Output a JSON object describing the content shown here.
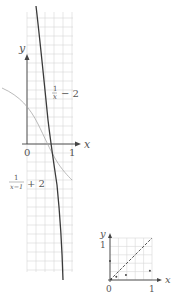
{
  "diagram": {
    "main_graph": {
      "x_axis_label": "x",
      "y_axis_label": "y",
      "origin_label": "0",
      "x_tick_label": "1",
      "curve_label_upper": {
        "numerator": "1",
        "denominator": "x",
        "suffix": "− 2"
      },
      "curve_label_lower": {
        "numerator": "1",
        "denominator": "x−1",
        "suffix": "+ 2"
      },
      "colors": {
        "grid": "#d6d6d6",
        "axis": "#444444",
        "dark_curve": "#3a3a3a",
        "light_curve": "#a8a8a8"
      }
    },
    "inset_graph": {
      "x_axis_label": "x",
      "y_axis_label": "y",
      "origin_label": "0",
      "x_tick_label": "1",
      "y_tick_label": "1",
      "diagonal": "dashed y = x",
      "points": [
        [
          0.0,
          0.45
        ],
        [
          0.15,
          0.08
        ],
        [
          0.38,
          0.12
        ],
        [
          0.95,
          0.22
        ],
        [
          0.03,
          0.02
        ]
      ]
    }
  }
}
